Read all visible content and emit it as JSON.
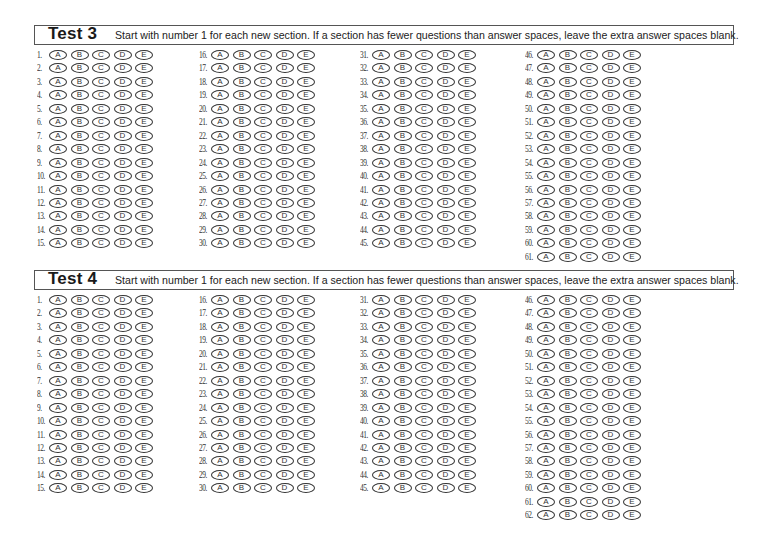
{
  "sections": [
    {
      "title": "Test 3",
      "instructions": "Start with number 1 for each new section.  If a section has fewer questions than answer spaces, leave the extra answer spaces blank.",
      "question_count": 61,
      "columns": [
        {
          "start": 1,
          "end": 15
        },
        {
          "start": 16,
          "end": 30
        },
        {
          "start": 31,
          "end": 45
        },
        {
          "start": 46,
          "end": 61
        }
      ]
    },
    {
      "title": "Test 4",
      "instructions": "Start with number 1 for each new section.  If a section has fewer questions than answer spaces, leave the extra answer spaces blank.",
      "question_count": 62,
      "columns": [
        {
          "start": 1,
          "end": 15
        },
        {
          "start": 16,
          "end": 30
        },
        {
          "start": 31,
          "end": 45
        },
        {
          "start": 46,
          "end": 62
        }
      ]
    }
  ],
  "choices": [
    "A",
    "B",
    "C",
    "D",
    "E"
  ],
  "colors": {
    "ink": "#333333",
    "border": "#555555",
    "background": "#ffffff"
  }
}
